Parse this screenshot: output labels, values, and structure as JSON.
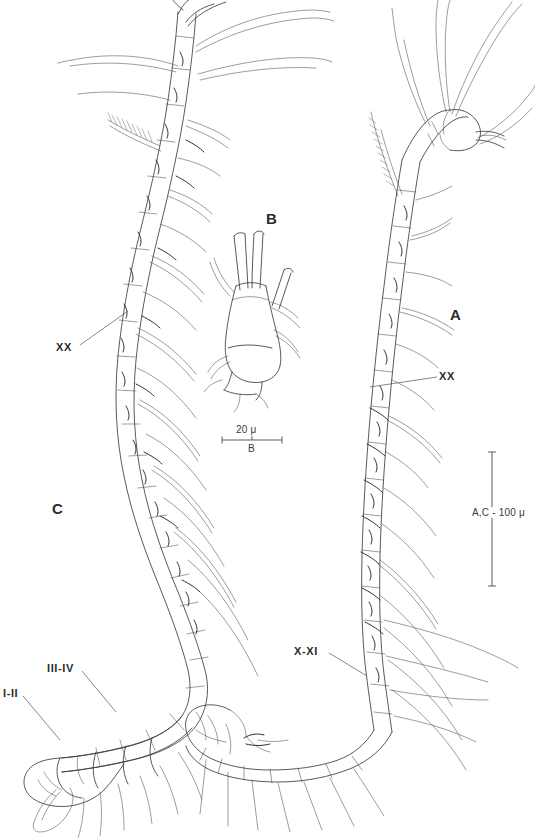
{
  "figure": {
    "kind": "scientific-line-drawing",
    "background_color": "#ffffff",
    "ink_color": "#3c3c3c"
  },
  "panels": [
    {
      "id": "A",
      "label": "A",
      "x": 450,
      "y": 313,
      "description": "right antenna, full length, distal segments with long setae"
    },
    {
      "id": "B",
      "label": "B",
      "x": 269,
      "y": 217,
      "description": "enlarged detail of a single segment bearing three aesthetascs"
    },
    {
      "id": "C",
      "label": "C",
      "x": 54,
      "y": 500,
      "description": "left antenna, full length, curved, with basal segments I-II and III-IV"
    }
  ],
  "annotations": [
    {
      "id": "xx-left",
      "text": "XX",
      "x": 58,
      "y": 341,
      "leader": {
        "x1": 80,
        "y1": 345,
        "x2": 128,
        "y2": 311
      }
    },
    {
      "id": "xx-right",
      "text": "XX",
      "x": 440,
      "y": 370,
      "leader": {
        "x1": 437,
        "y1": 377,
        "x2": 370,
        "y2": 387
      }
    },
    {
      "id": "x-xi",
      "text": "X-XI",
      "x": 296,
      "y": 646,
      "leader": {
        "x1": 329,
        "y1": 653,
        "x2": 367,
        "y2": 676
      }
    },
    {
      "id": "iii-iv",
      "text": "III-IV",
      "x": 49,
      "y": 663,
      "leader": {
        "x1": 82,
        "y1": 671,
        "x2": 116,
        "y2": 712
      }
    },
    {
      "id": "i-ii",
      "text": "I-II",
      "x": 4,
      "y": 688,
      "leader": {
        "x1": 23,
        "y1": 696,
        "x2": 60,
        "y2": 740
      }
    }
  ],
  "scale_bars": [
    {
      "id": "scale-b",
      "orientation": "horizontal",
      "value_label": "20 μ",
      "panel_label": "B",
      "x1": 222,
      "x2": 282,
      "y": 440,
      "tick_height": 7
    },
    {
      "id": "scale-ac",
      "orientation": "vertical",
      "value_label": "A,C - 100 μ",
      "x": 492,
      "y1": 452,
      "y2": 586,
      "tick_width": 8,
      "label_x": 472,
      "label_y": 514
    }
  ]
}
